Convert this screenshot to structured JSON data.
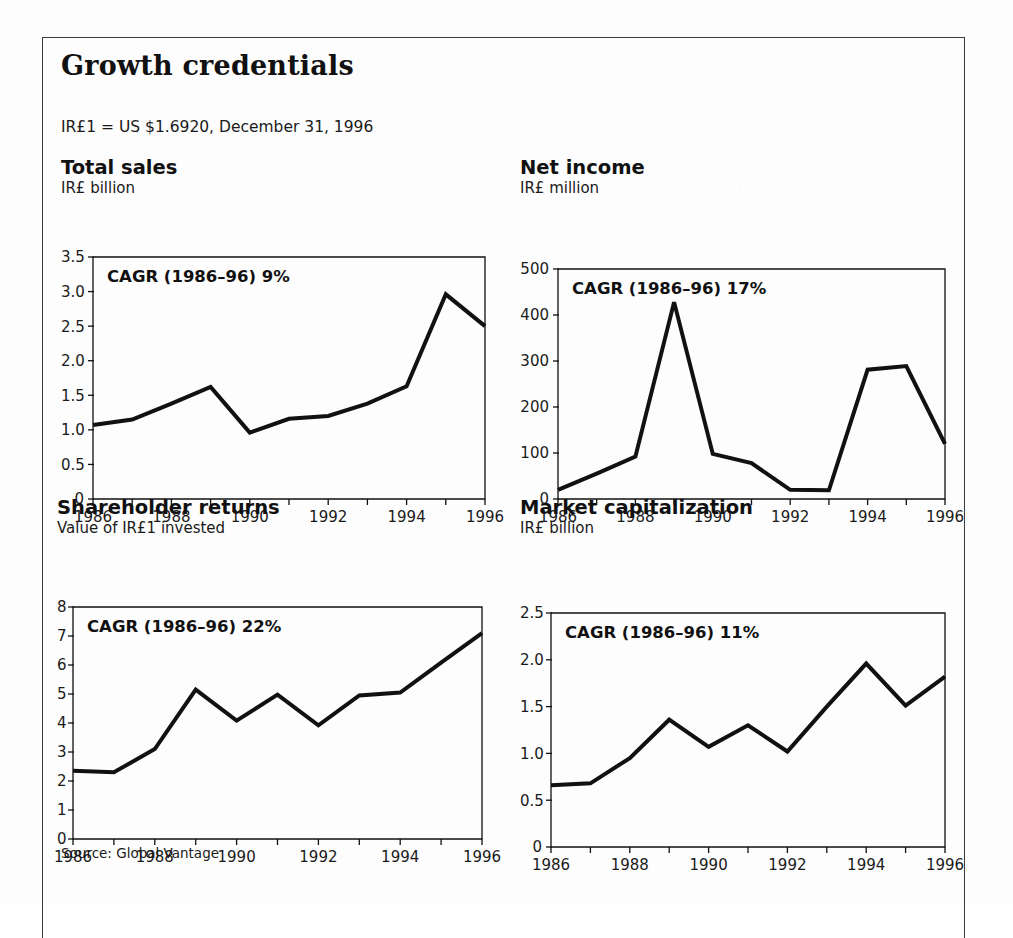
{
  "document": {
    "title": "Growth credentials",
    "fx_note": "IR£1 = US $1.6920, December 31, 1996",
    "source": "Source: Global Vantage",
    "ink_color": "#111111",
    "paper_color": "#fdfdfd"
  },
  "chart_data": [
    {
      "type": "line",
      "title": "Total sales",
      "subtitle": "IR£ billion",
      "annotation": "CAGR (1986–96) 9%",
      "xlabel": "",
      "ylabel": "IR£ billion",
      "x": [
        1986,
        1987,
        1988,
        1989,
        1990,
        1991,
        1992,
        1993,
        1994,
        1995,
        1996
      ],
      "values": [
        1.07,
        1.15,
        1.38,
        1.62,
        0.96,
        1.16,
        1.2,
        1.38,
        1.63,
        2.96,
        2.5
      ],
      "ylim": [
        0,
        3.5
      ],
      "yticks": [
        0,
        0.5,
        1.0,
        1.5,
        2.0,
        2.5,
        3.0,
        3.5
      ],
      "ytick_labels": [
        "0",
        "0.5",
        "1.0",
        "1.5",
        "2.0",
        "2.5",
        "3.0",
        "3.5"
      ],
      "xticks": [
        1986,
        1987,
        1988,
        1989,
        1990,
        1991,
        1992,
        1993,
        1994,
        1995,
        1996
      ],
      "xtick_labels": [
        "1986",
        "",
        "1988",
        "",
        "1990",
        "",
        "1992",
        "",
        "1994",
        "",
        "1996"
      ],
      "grid": false,
      "legend": "none"
    },
    {
      "type": "line",
      "title": "Net income",
      "subtitle": "IR£ million",
      "annotation": "CAGR (1986–96) 17%",
      "xlabel": "",
      "ylabel": "IR£ million",
      "x": [
        1986,
        1987,
        1988,
        1989,
        1990,
        1991,
        1992,
        1993,
        1994,
        1995,
        1996
      ],
      "values": [
        20,
        55,
        92,
        428,
        98,
        78,
        20,
        19,
        281,
        289,
        120
      ],
      "ylim": [
        0,
        500
      ],
      "yticks": [
        0,
        100,
        200,
        300,
        400,
        500
      ],
      "ytick_labels": [
        "0",
        "100",
        "200",
        "300",
        "400",
        "500"
      ],
      "xticks": [
        1986,
        1987,
        1988,
        1989,
        1990,
        1991,
        1992,
        1993,
        1994,
        1995,
        1996
      ],
      "xtick_labels": [
        "1986",
        "",
        "1988",
        "",
        "1990",
        "",
        "1992",
        "",
        "1994",
        "",
        "1996"
      ],
      "grid": false,
      "legend": "none"
    },
    {
      "type": "line",
      "title": "Shareholder returns",
      "subtitle": "Value of IR£1 invested",
      "annotation": "CAGR (1986–96) 22%",
      "xlabel": "",
      "ylabel": "Value of IR£1 invested",
      "x": [
        1986,
        1987,
        1988,
        1989,
        1990,
        1991,
        1992,
        1993,
        1994,
        1995,
        1996
      ],
      "values": [
        2.35,
        2.3,
        3.1,
        5.15,
        4.08,
        4.98,
        3.92,
        4.95,
        5.05,
        6.08,
        7.1
      ],
      "ylim": [
        0,
        8
      ],
      "yticks": [
        0,
        1,
        2,
        3,
        4,
        5,
        6,
        7,
        8
      ],
      "ytick_labels": [
        "0",
        "1",
        "2",
        "3",
        "4",
        "5",
        "6",
        "7",
        "8"
      ],
      "xticks": [
        1986,
        1987,
        1988,
        1989,
        1990,
        1991,
        1992,
        1993,
        1994,
        1995,
        1996
      ],
      "xtick_labels": [
        "1986",
        "",
        "1988",
        "",
        "1990",
        "",
        "1992",
        "",
        "1994",
        "",
        "1996"
      ],
      "grid": false,
      "legend": "none"
    },
    {
      "type": "line",
      "title": "Market capitalization",
      "subtitle": "IR£ billion",
      "annotation": "CAGR (1986–96) 11%",
      "xlabel": "",
      "ylabel": "IR£ billion",
      "x": [
        1986,
        1987,
        1988,
        1989,
        1990,
        1991,
        1992,
        1993,
        1994,
        1995,
        1996
      ],
      "values": [
        0.66,
        0.68,
        0.95,
        1.36,
        1.07,
        1.3,
        1.02,
        1.5,
        1.96,
        1.51,
        1.82
      ],
      "ylim": [
        0,
        2.5
      ],
      "yticks": [
        0,
        0.5,
        1.0,
        1.5,
        2.0,
        2.5
      ],
      "ytick_labels": [
        "0",
        "0.5",
        "1.0",
        "1.5",
        "2.0",
        "2.5"
      ],
      "xticks": [
        1986,
        1987,
        1988,
        1989,
        1990,
        1991,
        1992,
        1993,
        1994,
        1995,
        1996
      ],
      "xtick_labels": [
        "1986",
        "",
        "1988",
        "",
        "1990",
        "",
        "1992",
        "",
        "1994",
        "",
        "1996"
      ],
      "grid": false,
      "legend": "none"
    }
  ],
  "panels": [
    {
      "id": "total-sales",
      "left": 61,
      "top": 158,
      "plot_left": 32,
      "plot_top": 60,
      "plot_w": 392,
      "plot_h": 242
    },
    {
      "id": "net-income",
      "left": 520,
      "top": 158,
      "plot_left": 38,
      "plot_top": 72,
      "plot_w": 387,
      "plot_h": 230
    },
    {
      "id": "shareholder-returns",
      "left": 57,
      "top": 498,
      "plot_left": 16,
      "plot_top": 70,
      "plot_w": 409,
      "plot_h": 232
    },
    {
      "id": "market-capitalization",
      "left": 520,
      "top": 498,
      "plot_left": 31,
      "plot_top": 76,
      "plot_w": 394,
      "plot_h": 234
    }
  ]
}
